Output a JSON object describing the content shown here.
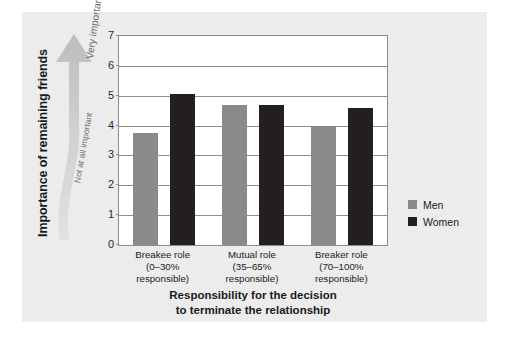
{
  "chart_data": {
    "type": "bar",
    "title": "",
    "categories": [
      "Breakee role (0–30% responsible)",
      "Mutual role (35–65% responsible)",
      "Breaker role (70–100% responsible)"
    ],
    "category_lines": [
      [
        "Breakee role",
        "(0–30%",
        "responsible)"
      ],
      [
        "Mutual role",
        "(35–65%",
        "responsible)"
      ],
      [
        "Breaker role",
        "(70–100%",
        "responsible)"
      ]
    ],
    "series": [
      {
        "name": "Men",
        "color": "#8a8a8a",
        "values": [
          3.75,
          4.7,
          3.98
        ]
      },
      {
        "name": "Women",
        "color": "#231f20",
        "values": [
          5.05,
          4.7,
          4.6
        ]
      }
    ],
    "xlabel_lines": [
      "Responsibility for the decision",
      "to terminate the relationship"
    ],
    "ylabel": "Importance of remaining friends",
    "ylim": [
      0,
      7
    ],
    "yticks": [
      0,
      1,
      2,
      3,
      4,
      5,
      6,
      7
    ],
    "ytick_labels": [
      "0",
      "1",
      "2",
      "3",
      "4",
      "5",
      "6",
      "7"
    ],
    "grid": true,
    "legend_position": "right"
  },
  "annotations": {
    "arrow_top_label": "Very important",
    "arrow_bottom_label": "Not at all important",
    "arrow_color": "#c8c8c8"
  },
  "legend": {
    "items": [
      {
        "label": "Men",
        "color": "#8a8a8a"
      },
      {
        "label": "Women",
        "color": "#231f20"
      }
    ]
  },
  "colors": {
    "panel_background": "#ececec",
    "plot_background": "#ffffff",
    "axis": "#8c8c8c",
    "text": "#1a1a1a"
  }
}
